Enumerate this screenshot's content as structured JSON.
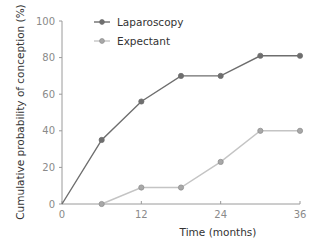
{
  "chart_data": {
    "type": "line",
    "title": "",
    "xlabel": "Time (months)",
    "ylabel": "Cumulative probability of conception (%)",
    "xlim": [
      0,
      36
    ],
    "ylim": [
      0,
      100
    ],
    "xticks": [
      0,
      12,
      24,
      36
    ],
    "yticks": [
      0,
      20,
      40,
      60,
      80,
      100
    ],
    "grid": false,
    "legend_position": "top-left",
    "series": [
      {
        "name": "Laparoscopy",
        "color": "#6e6e6e",
        "marker_fill": "#6e6e6e",
        "x": [
          0,
          6,
          12,
          18,
          24,
          30,
          36
        ],
        "y": [
          0,
          35,
          56,
          70,
          70,
          81,
          81
        ]
      },
      {
        "name": "Expectant",
        "color": "#c4c4c4",
        "marker_fill": "#a8a8a8",
        "x": [
          6,
          12,
          18,
          24,
          30,
          36
        ],
        "y": [
          0,
          9,
          9,
          23,
          40,
          40
        ]
      }
    ]
  },
  "colors": {
    "axis": "#9a9a9a",
    "tick_label": "#8a8a8a",
    "text": "#333333"
  }
}
